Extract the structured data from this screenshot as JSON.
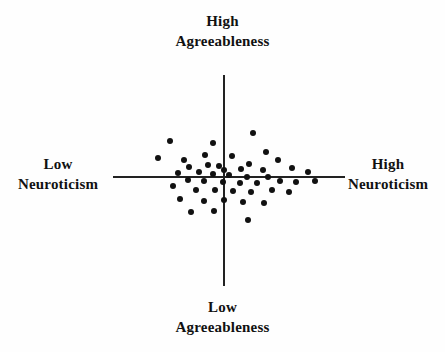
{
  "figure": {
    "title_top": {
      "line1": "High",
      "line2": "Agreeableness"
    },
    "title_bottom": {
      "line1": "Low",
      "line2": "Agreeableness"
    },
    "title_left": {
      "line1": "Low",
      "line2": "Neuroticism"
    },
    "title_right": {
      "line1": "High",
      "line2": "Neuroticism"
    },
    "background_color": "#fefefe",
    "axis_color": "#222222",
    "point_color": "#111111"
  },
  "chart_data": {
    "type": "scatter",
    "title": "",
    "subtitle": "",
    "xlabel": "Neuroticism",
    "ylabel": "Agreeableness",
    "xlabel_low": "Low Neuroticism",
    "xlabel_high": "High Neuroticism",
    "ylabel_low": "Low Agreeableness",
    "ylabel_high": "High Agreeableness",
    "xlim": [
      -100,
      100
    ],
    "ylim": [
      -100,
      100
    ],
    "grid": false,
    "legend": false,
    "axes_style": "crosshair-through-origin",
    "axis_origin_px": [
      224,
      177
    ],
    "x_axis_extent_px": [
      113,
      345
    ],
    "y_axis_extent_px": [
      75,
      286
    ],
    "point_radius_px": 3,
    "n_points": 47,
    "points_px": [
      [
        170,
        141
      ],
      [
        213,
        143
      ],
      [
        253,
        133
      ],
      [
        205,
        155
      ],
      [
        158,
        158
      ],
      [
        184,
        160
      ],
      [
        266,
        152
      ],
      [
        232,
        156
      ],
      [
        208,
        165
      ],
      [
        249,
        164
      ],
      [
        278,
        160
      ],
      [
        189,
        167
      ],
      [
        219,
        166
      ],
      [
        241,
        169
      ],
      [
        263,
        170
      ],
      [
        292,
        168
      ],
      [
        224,
        170
      ],
      [
        178,
        173
      ],
      [
        199,
        172
      ],
      [
        213,
        174
      ],
      [
        229,
        175
      ],
      [
        247,
        177
      ],
      [
        268,
        177
      ],
      [
        308,
        172
      ],
      [
        188,
        180
      ],
      [
        204,
        181
      ],
      [
        223,
        182
      ],
      [
        240,
        183
      ],
      [
        257,
        183
      ],
      [
        280,
        181
      ],
      [
        296,
        182
      ],
      [
        315,
        181
      ],
      [
        173,
        186
      ],
      [
        196,
        190
      ],
      [
        215,
        190
      ],
      [
        233,
        191
      ],
      [
        251,
        192
      ],
      [
        272,
        190
      ],
      [
        289,
        192
      ],
      [
        180,
        199
      ],
      [
        204,
        201
      ],
      [
        224,
        200
      ],
      [
        243,
        202
      ],
      [
        264,
        203
      ],
      [
        191,
        212
      ],
      [
        214,
        211
      ],
      [
        248,
        220
      ]
    ],
    "points_data": [
      [
        -46.6,
        36.0
      ],
      [
        -9.5,
        34.3
      ],
      [
        25.0,
        43.0
      ],
      [
        -16.4,
        22.9
      ],
      [
        -56.9,
        20.3
      ],
      [
        -34.5,
        18.6
      ],
      [
        36.2,
        25.4
      ],
      [
        6.9,
        21.2
      ],
      [
        -13.8,
        12.7
      ],
      [
        21.6,
        13.6
      ],
      [
        46.6,
        18.6
      ],
      [
        -30.2,
        10.2
      ],
      [
        -4.3,
        11.0
      ],
      [
        14.7,
        8.5
      ],
      [
        33.6,
        7.6
      ],
      [
        58.6,
        9.3
      ],
      [
        0.0,
        7.6
      ],
      [
        -39.7,
        4.2
      ],
      [
        -21.6,
        5.1
      ],
      [
        -9.5,
        3.4
      ],
      [
        4.3,
        2.5
      ],
      [
        19.8,
        0.0
      ],
      [
        37.9,
        0.0
      ],
      [
        72.4,
        5.1
      ],
      [
        -31.0,
        -2.5
      ],
      [
        -17.2,
        -3.4
      ],
      [
        -0.9,
        -4.2
      ],
      [
        13.8,
        -5.1
      ],
      [
        28.4,
        -5.1
      ],
      [
        48.3,
        -3.4
      ],
      [
        62.1,
        -4.2
      ],
      [
        78.4,
        -3.4
      ],
      [
        -44.0,
        -7.6
      ],
      [
        -24.1,
        -11.0
      ],
      [
        -7.8,
        -11.0
      ],
      [
        7.8,
        -11.9
      ],
      [
        23.3,
        -12.7
      ],
      [
        41.4,
        -11.0
      ],
      [
        56.0,
        -12.7
      ],
      [
        -37.9,
        -18.6
      ],
      [
        -17.2,
        -20.3
      ],
      [
        0.0,
        -19.5
      ],
      [
        16.4,
        -21.2
      ],
      [
        34.5,
        -22.0
      ],
      [
        -28.4,
        -29.7
      ],
      [
        -8.6,
        -28.8
      ],
      [
        20.7,
        -36.4
      ]
    ]
  }
}
